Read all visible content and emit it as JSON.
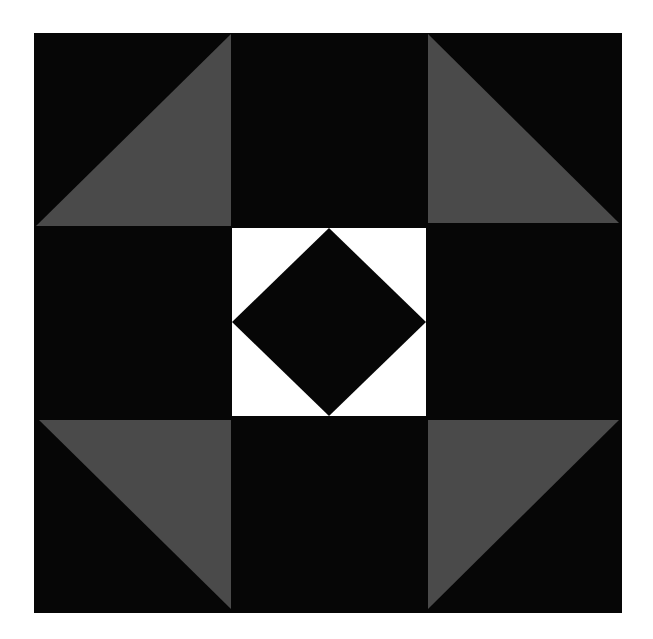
{
  "canvas": {
    "width": 653,
    "height": 639,
    "background": "#ffffff"
  },
  "colors": {
    "black": "#060606",
    "gray": "#4a4a4a",
    "white": "#ffffff"
  },
  "block": {
    "outer": {
      "x": 34,
      "y": 33,
      "width": 588,
      "height": 580
    },
    "grid": {
      "columns": [
        34,
        231,
        428,
        622
      ],
      "rows": [
        33,
        226,
        419,
        613
      ]
    },
    "corner_triangles": [
      {
        "name": "top-left",
        "fill": "gray",
        "points": "231,34 231,226 36,226"
      },
      {
        "name": "top-right",
        "fill": "gray",
        "points": "428,34 428,223 619,223"
      },
      {
        "name": "bottom-left",
        "fill": "gray",
        "points": "39,420 231,420 231,609"
      },
      {
        "name": "bottom-right",
        "fill": "gray",
        "points": "428,420 619,420 428,609"
      }
    ],
    "center_square": {
      "x": 232,
      "y": 228,
      "width": 194,
      "height": 188,
      "fill": "white"
    },
    "center_diamond": {
      "points": "329,228 426,322 329,416 232,322",
      "fill": "black"
    }
  }
}
